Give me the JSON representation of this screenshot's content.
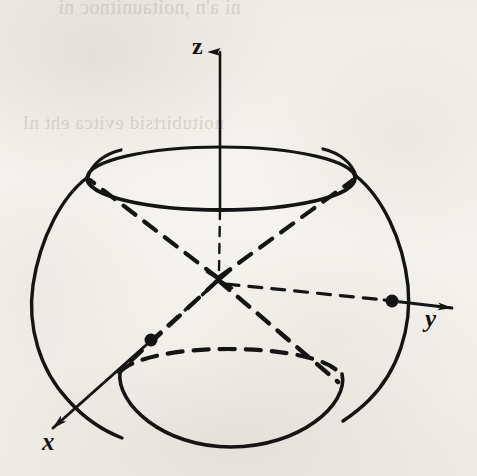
{
  "figure": {
    "kind": "3d-geometry-diagram",
    "background_color": "#f2efe9",
    "ink_color": "#141414",
    "axes": [
      {
        "id": "z",
        "label": "z",
        "direction": "up",
        "style": "solid-with-dashed-interior",
        "arrow": true,
        "marker": false
      },
      {
        "id": "y",
        "label": "y",
        "direction": "right",
        "style": "dashed-then-solid",
        "arrow": true,
        "marker": true
      },
      {
        "id": "x",
        "label": "x",
        "direction": "down-left",
        "style": "dashed-then-solid",
        "arrow": true,
        "marker": true
      }
    ],
    "markers": [
      {
        "on_axis": "y",
        "x": 393,
        "y": 302,
        "radius": 6
      },
      {
        "on_axis": "x",
        "x": 150,
        "y": 340,
        "radius": 6
      }
    ],
    "shapes": [
      {
        "name": "sphere-outline",
        "type": "circle-arc-pair",
        "cx": 220,
        "cy": 294,
        "rx": 188,
        "ry": 160,
        "stroke": "solid"
      },
      {
        "name": "upper-cone-rim",
        "type": "ellipse",
        "cx": 221,
        "cy": 178,
        "rx": 134,
        "ry": 32,
        "stroke": "solid"
      },
      {
        "name": "lower-cone-rim-front",
        "type": "ellipse-arc",
        "cx": 227,
        "cy": 358,
        "rx": 108,
        "ry": 90,
        "stroke": "solid"
      },
      {
        "name": "lower-cone-rim-back",
        "type": "ellipse-arc",
        "cx": 227,
        "cy": 358,
        "rx": 108,
        "ry": 90,
        "stroke": "dashed"
      },
      {
        "name": "upper-cone-slant-left",
        "type": "line",
        "stroke": "dashed"
      },
      {
        "name": "upper-cone-slant-right",
        "type": "line",
        "stroke": "dashed"
      },
      {
        "name": "lower-cone-slant-left",
        "type": "line",
        "stroke": "dashed"
      },
      {
        "name": "lower-cone-slant-right",
        "type": "line",
        "stroke": "dashed"
      }
    ],
    "origin": {
      "x": 218,
      "y": 279
    }
  },
  "bleed_through": {
    "line_1": "ni a'n  ,noitaunitnoc  ni",
    "line_2": "noitubirtsid  evitca  eht  nI"
  }
}
